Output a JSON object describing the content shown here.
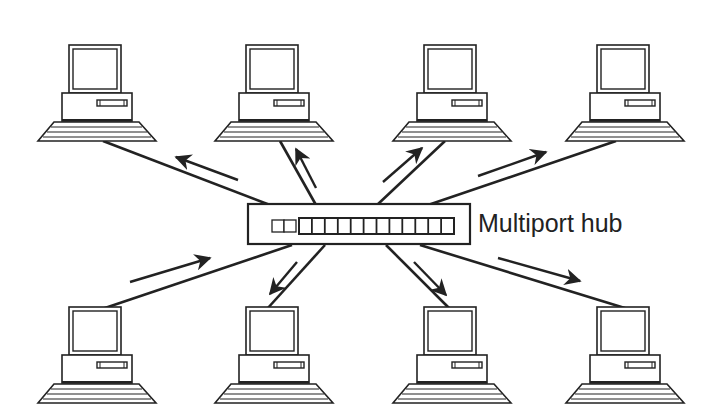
{
  "diagram": {
    "type": "star network topology",
    "hub_label": "Multiport hub",
    "hub_ports": 13,
    "stroke_color": "#222222",
    "background": "#ffffff",
    "computers": [
      {
        "id": "pc-top-1",
        "row": "top",
        "x": 38,
        "y": 45,
        "data_flow": "from-hub"
      },
      {
        "id": "pc-top-2",
        "row": "top",
        "x": 215,
        "y": 45,
        "data_flow": "from-hub"
      },
      {
        "id": "pc-top-3",
        "row": "top",
        "x": 393,
        "y": 45,
        "data_flow": "from-hub"
      },
      {
        "id": "pc-top-4",
        "row": "top",
        "x": 566,
        "y": 45,
        "data_flow": "from-hub"
      },
      {
        "id": "pc-bottom-1",
        "row": "bottom",
        "x": 38,
        "y": 307,
        "data_flow": "to-hub"
      },
      {
        "id": "pc-bottom-2",
        "row": "bottom",
        "x": 215,
        "y": 307,
        "data_flow": "from-hub"
      },
      {
        "id": "pc-bottom-3",
        "row": "bottom",
        "x": 393,
        "y": 307,
        "data_flow": "from-hub"
      },
      {
        "id": "pc-bottom-4",
        "row": "bottom",
        "x": 566,
        "y": 307,
        "data_flow": "from-hub"
      }
    ]
  }
}
